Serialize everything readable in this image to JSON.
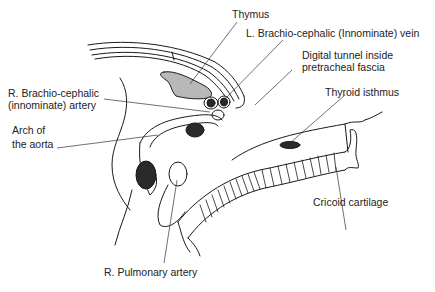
{
  "diagram": {
    "labels": {
      "thymus": "Thymus",
      "l_brachiocephalic_vein": "L. Brachio-cephalic (Innominate) vein",
      "digital_tunnel_line1": "Digital tunnel inside",
      "digital_tunnel_line2": "pretracheal fascia",
      "thyroid_isthmus": "Thyroid isthmus",
      "r_brachiocephalic_artery_line1": "R. Brachio-cephalic",
      "r_brachiocephalic_artery_line2": "(innominate) artery",
      "arch_aorta_line1": "Arch of",
      "arch_aorta_line2": "the aorta",
      "cricoid_cartilage": "Cricoid cartilage",
      "r_pulmonary_artery": "R. Pulmonary artery"
    },
    "colors": {
      "line": "#1a1a1a",
      "fill_dark": "#2a2a2a",
      "fill_shade": "#9a9a9a",
      "background": "#ffffff"
    }
  }
}
